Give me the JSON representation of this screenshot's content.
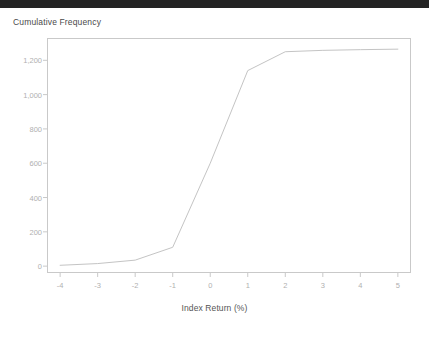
{
  "window": {
    "top_bar_color": "#242424"
  },
  "chart_data": {
    "type": "line",
    "title": "Cumulative Frequency",
    "xlabel": "Index Return (%)",
    "ylabel": "",
    "xlim": [
      -4.35,
      5.35
    ],
    "ylim": [
      -40,
      1330
    ],
    "grid": false,
    "legend": "none",
    "line_color": "#c4c4c4",
    "axis_color": "#c9c9c9",
    "tick_label_color": "#b0b0b0",
    "x_ticks": [
      -4,
      -3,
      -2,
      -1,
      0,
      1,
      2,
      3,
      4,
      5
    ],
    "x_tick_labels": [
      "-4",
      "-3",
      "-2",
      "-1",
      "0",
      "1",
      "2",
      "3",
      "4",
      "5"
    ],
    "y_ticks": [
      0,
      200,
      400,
      600,
      800,
      1000,
      1200
    ],
    "y_tick_labels": [
      "0",
      "200",
      "400",
      "600",
      "800",
      "1,000",
      "1,200"
    ],
    "series": [
      {
        "name": "Cumulative Frequency",
        "x": [
          -4,
          -3,
          -2,
          -1,
          0,
          1,
          2,
          3,
          4,
          5
        ],
        "values": [
          5,
          15,
          35,
          110,
          600,
          1140,
          1250,
          1258,
          1262,
          1265
        ]
      }
    ]
  }
}
